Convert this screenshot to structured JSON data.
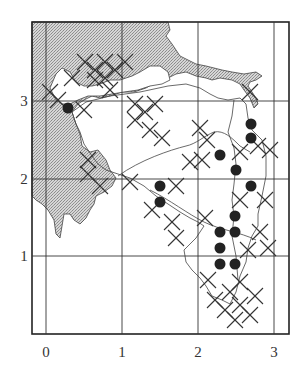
{
  "map": {
    "frame": {
      "left": 32,
      "top": 22,
      "right": 289,
      "bottom": 334
    },
    "colors": {
      "land_shade": "#c8c8c8",
      "line": "#333333",
      "dot": "#222222",
      "background": "#ffffff"
    },
    "x_axis": {
      "ticks": [
        {
          "label": "0",
          "px": 46
        },
        {
          "label": "1",
          "px": 122
        },
        {
          "label": "2",
          "px": 198
        },
        {
          "label": "3",
          "px": 274
        }
      ],
      "label_y": 357
    },
    "y_axis": {
      "ticks": [
        {
          "label": "3",
          "py": 101
        },
        {
          "label": "2",
          "py": 179
        },
        {
          "label": "1",
          "py": 256
        }
      ],
      "label_x": 24
    },
    "legend_symbols": {
      "dot": "filled-circle-record",
      "cross": "x-mark-record"
    },
    "dots": [
      {
        "x": 68,
        "y": 108
      },
      {
        "x": 251,
        "y": 124
      },
      {
        "x": 251,
        "y": 138
      },
      {
        "x": 220,
        "y": 155
      },
      {
        "x": 236,
        "y": 170
      },
      {
        "x": 251,
        "y": 186
      },
      {
        "x": 160,
        "y": 186
      },
      {
        "x": 160,
        "y": 202
      },
      {
        "x": 235,
        "y": 216
      },
      {
        "x": 220,
        "y": 232
      },
      {
        "x": 235,
        "y": 232
      },
      {
        "x": 220,
        "y": 248
      },
      {
        "x": 220,
        "y": 264
      },
      {
        "x": 235,
        "y": 264
      }
    ],
    "crosses": [
      {
        "x": 85,
        "y": 62
      },
      {
        "x": 95,
        "y": 70
      },
      {
        "x": 105,
        "y": 62
      },
      {
        "x": 95,
        "y": 80
      },
      {
        "x": 105,
        "y": 78
      },
      {
        "x": 115,
        "y": 70
      },
      {
        "x": 125,
        "y": 62
      },
      {
        "x": 110,
        "y": 90
      },
      {
        "x": 72,
        "y": 78
      },
      {
        "x": 50,
        "y": 92
      },
      {
        "x": 58,
        "y": 100
      },
      {
        "x": 84,
        "y": 110
      },
      {
        "x": 135,
        "y": 104
      },
      {
        "x": 135,
        "y": 120
      },
      {
        "x": 145,
        "y": 112
      },
      {
        "x": 155,
        "y": 104
      },
      {
        "x": 150,
        "y": 130
      },
      {
        "x": 162,
        "y": 138
      },
      {
        "x": 200,
        "y": 128
      },
      {
        "x": 207,
        "y": 140
      },
      {
        "x": 202,
        "y": 160
      },
      {
        "x": 190,
        "y": 162
      },
      {
        "x": 240,
        "y": 152
      },
      {
        "x": 258,
        "y": 146
      },
      {
        "x": 270,
        "y": 150
      },
      {
        "x": 250,
        "y": 92
      },
      {
        "x": 88,
        "y": 160
      },
      {
        "x": 88,
        "y": 174
      },
      {
        "x": 100,
        "y": 186
      },
      {
        "x": 130,
        "y": 182
      },
      {
        "x": 176,
        "y": 186
      },
      {
        "x": 152,
        "y": 210
      },
      {
        "x": 172,
        "y": 222
      },
      {
        "x": 176,
        "y": 238
      },
      {
        "x": 205,
        "y": 218
      },
      {
        "x": 240,
        "y": 200
      },
      {
        "x": 248,
        "y": 250
      },
      {
        "x": 265,
        "y": 200
      },
      {
        "x": 260,
        "y": 232
      },
      {
        "x": 268,
        "y": 248
      },
      {
        "x": 208,
        "y": 280
      },
      {
        "x": 215,
        "y": 300
      },
      {
        "x": 230,
        "y": 292
      },
      {
        "x": 240,
        "y": 282
      },
      {
        "x": 225,
        "y": 310
      },
      {
        "x": 240,
        "y": 305
      },
      {
        "x": 255,
        "y": 296
      },
      {
        "x": 250,
        "y": 315
      },
      {
        "x": 235,
        "y": 320
      }
    ]
  }
}
